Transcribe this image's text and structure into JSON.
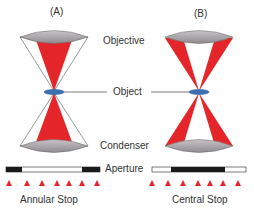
{
  "panels": [
    {
      "label": "(A)",
      "stop_label": "Annular Stop"
    },
    {
      "label": "(B)",
      "stop_label": "Central Stop"
    }
  ],
  "labels": {
    "objective": "Objective",
    "object": "Object",
    "condenser": "Condenser",
    "aperture": "Aperture"
  },
  "colors": {
    "light_cone": "#e4262a",
    "lens_fill": "#a8a2a6",
    "object_fill": "#3b6fb6",
    "stop_dark": "#1a1a1a",
    "arrow": "#e4262a",
    "text": "#333333"
  }
}
